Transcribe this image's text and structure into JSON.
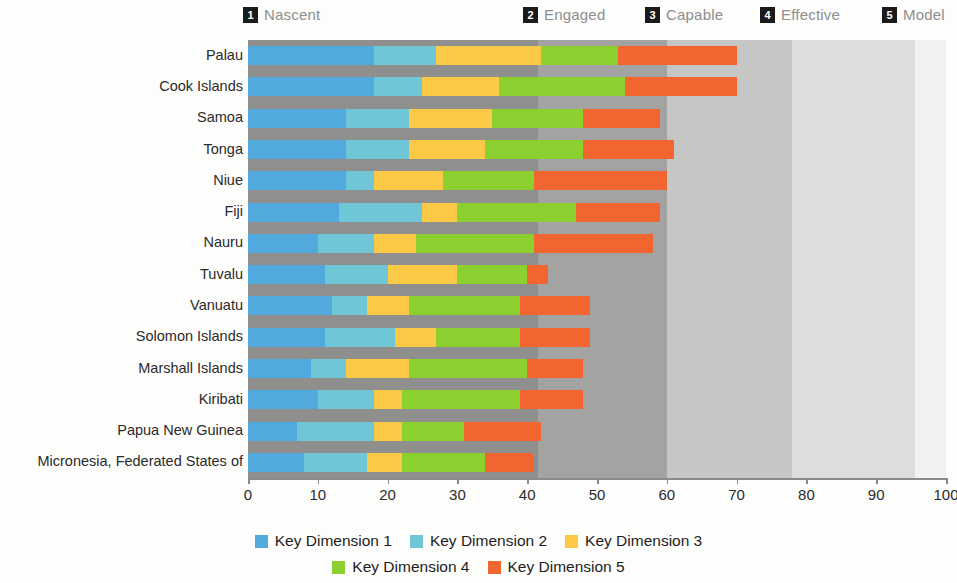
{
  "maturity_header": {
    "items": [
      {
        "num": "1",
        "label": "Nascent",
        "x_px": 243
      },
      {
        "num": "2",
        "label": "Engaged",
        "x_px": 523
      },
      {
        "num": "3",
        "label": "Capable",
        "x_px": 645
      },
      {
        "num": "4",
        "label": "Effective",
        "x_px": 760
      },
      {
        "num": "5",
        "label": "Model",
        "x_px": 882
      }
    ]
  },
  "axes": {
    "x_ticks": [
      0,
      10,
      20,
      30,
      40,
      50,
      60,
      70,
      80,
      90,
      100
    ],
    "x_min": 0,
    "x_max": 100
  },
  "background_bands": [
    {
      "name": "nascent-band",
      "from": 0,
      "to": 41.5,
      "color": "#8f8f8d"
    },
    {
      "name": "engaged-band",
      "from": 41.5,
      "to": 60,
      "color": "#a3a3a1"
    },
    {
      "name": "capable-band",
      "from": 60,
      "to": 78,
      "color": "#c6c6c4"
    },
    {
      "name": "effective-band",
      "from": 78,
      "to": 95.5,
      "color": "#dedddb"
    },
    {
      "name": "model-band",
      "from": 95.5,
      "to": 100,
      "color": "#f2f1ef"
    }
  ],
  "series_colors": {
    "Key Dimension 1": "#51a9dd",
    "Key Dimension 2": "#6fc6d6",
    "Key Dimension 3": "#fbc945",
    "Key Dimension 4": "#8cd02f",
    "Key Dimension 5": "#f26531"
  },
  "legend": {
    "row1": [
      "Key Dimension 1",
      "Key Dimension 2",
      "Key Dimension 3"
    ],
    "row2": [
      "Key Dimension 4",
      "Key Dimension 5"
    ]
  },
  "chart_data": {
    "type": "bar",
    "orientation": "horizontal",
    "stacked": true,
    "title": "",
    "xlabel": "",
    "ylabel": "",
    "xlim": [
      0,
      100
    ],
    "grid": false,
    "legend_position": "bottom",
    "categories": [
      "Palau",
      "Cook Islands",
      "Samoa",
      "Tonga",
      "Niue",
      "Fiji",
      "Nauru",
      "Tuvalu",
      "Vanuatu",
      "Solomon Islands",
      "Marshall Islands",
      "Kiribati",
      "Papua New Guinea",
      "Micronesia, Federated States of"
    ],
    "series": [
      {
        "name": "Key Dimension 1",
        "values": [
          18,
          18,
          14,
          14,
          14,
          13,
          10,
          11,
          12,
          11,
          9,
          10,
          7,
          8
        ]
      },
      {
        "name": "Key Dimension 2",
        "values": [
          9,
          7,
          9,
          9,
          4,
          12,
          8,
          9,
          5,
          10,
          5,
          8,
          11,
          9
        ]
      },
      {
        "name": "Key Dimension 3",
        "values": [
          15,
          11,
          12,
          11,
          10,
          5,
          6,
          10,
          6,
          6,
          9,
          4,
          4,
          5
        ]
      },
      {
        "name": "Key Dimension 4",
        "values": [
          11,
          18,
          13,
          14,
          13,
          17,
          17,
          10,
          16,
          12,
          17,
          17,
          9,
          12
        ]
      },
      {
        "name": "Key Dimension 5",
        "values": [
          17,
          16,
          11,
          13,
          19,
          12,
          17,
          3,
          10,
          10,
          8,
          9,
          11,
          7
        ]
      }
    ],
    "totals": [
      70,
      70,
      59,
      61,
      60,
      59,
      58,
      43,
      49,
      49,
      48,
      48,
      42,
      41
    ],
    "maturity_tiers": [
      {
        "num": 1,
        "label": "Nascent"
      },
      {
        "num": 2,
        "label": "Engaged"
      },
      {
        "num": 3,
        "label": "Capable"
      },
      {
        "num": 4,
        "label": "Effective"
      },
      {
        "num": 5,
        "label": "Model"
      }
    ]
  }
}
